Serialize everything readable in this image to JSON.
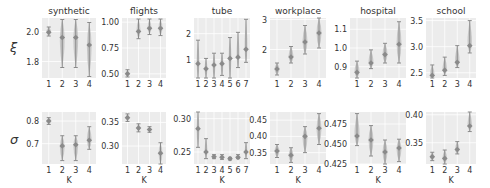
{
  "figure": {
    "row_labels": [
      "ξ",
      "σ"
    ],
    "xlabel": "K",
    "colors": {
      "panel_bg": "#ececec",
      "grid": "#ffffff",
      "marker": "#8a8a8a",
      "violin": "#b8b8b8",
      "text": "#333333"
    }
  },
  "chart_data": [
    {
      "type": "errorbar",
      "row": "xi",
      "title": "synthetic",
      "ylabel": "ξ",
      "categories": [
        "1",
        "2",
        "3",
        "4"
      ],
      "ylim": [
        1.69,
        2.09
      ],
      "yticks": [
        1.8,
        2.0
      ],
      "yticklabels": [
        "1.8",
        "2.0"
      ],
      "values": [
        1.995,
        1.96,
        1.96,
        1.91
      ],
      "lower": [
        1.97,
        1.76,
        1.76,
        1.7
      ],
      "upper": [
        2.03,
        2.08,
        2.08,
        2.06
      ]
    },
    {
      "type": "errorbar",
      "row": "xi",
      "title": "flights",
      "categories": [
        "1",
        "2",
        "3",
        "4"
      ],
      "ylim": [
        0.46,
        1.04
      ],
      "yticks": [
        0.5,
        0.75,
        1.0
      ],
      "yticklabels": [
        "0.50",
        "0.75",
        "1.00"
      ],
      "values": [
        0.5,
        0.91,
        0.94,
        0.94
      ],
      "lower": [
        0.47,
        0.84,
        0.88,
        0.87
      ],
      "upper": [
        0.54,
        1.03,
        1.03,
        1.03
      ]
    },
    {
      "type": "errorbar",
      "row": "xi",
      "title": "tube",
      "categories": [
        "1",
        "2",
        "3",
        "4",
        "5",
        "6",
        "7"
      ],
      "ylim": [
        0.3,
        2.6
      ],
      "yticks": [
        1,
        2
      ],
      "yticklabels": [
        "1",
        "2"
      ],
      "values": [
        0.85,
        0.65,
        0.8,
        0.85,
        1.05,
        1.1,
        1.4
      ],
      "lower": [
        0.3,
        0.3,
        0.3,
        0.4,
        0.3,
        0.7,
        0.9
      ],
      "upper": [
        1.75,
        1.05,
        1.25,
        1.25,
        1.85,
        2.05,
        2.55
      ]
    },
    {
      "type": "errorbar",
      "row": "xi",
      "title": "workplace",
      "categories": [
        "1",
        "2",
        "3",
        "4"
      ],
      "ylim": [
        1.05,
        3.05
      ],
      "yticks": [
        2,
        3
      ],
      "yticklabels": [
        "2",
        "3"
      ],
      "values": [
        1.35,
        1.75,
        2.25,
        2.55
      ],
      "lower": [
        1.15,
        1.55,
        1.85,
        2.05
      ],
      "upper": [
        1.55,
        2.1,
        2.8,
        3.05
      ]
    },
    {
      "type": "errorbar",
      "row": "xi",
      "title": "hospital",
      "categories": [
        "1",
        "2",
        "3",
        "4"
      ],
      "ylim": [
        0.84,
        1.16
      ],
      "yticks": [
        0.9,
        1.0,
        1.1
      ],
      "yticklabels": [
        "0.9",
        "1.0",
        "1.1"
      ],
      "values": [
        0.87,
        0.92,
        0.965,
        1.02
      ],
      "lower": [
        0.84,
        0.89,
        0.92,
        0.92
      ],
      "upper": [
        0.93,
        0.99,
        1.025,
        1.14
      ]
    },
    {
      "type": "errorbar",
      "row": "xi",
      "title": "school",
      "categories": [
        "1",
        "2",
        "3",
        "4"
      ],
      "ylim": [
        2.4,
        3.55
      ],
      "yticks": [
        2.5,
        3.0,
        3.5
      ],
      "yticklabels": [
        "2.5",
        "3.0",
        "3.5"
      ],
      "values": [
        2.45,
        2.55,
        2.7,
        3.02
      ],
      "lower": [
        2.4,
        2.45,
        2.6,
        2.88
      ],
      "upper": [
        2.65,
        2.8,
        3.02,
        3.5
      ]
    },
    {
      "type": "errorbar",
      "row": "sigma",
      "title": "",
      "ylabel": "σ",
      "xlabel": "K",
      "categories": [
        "1",
        "2",
        "3",
        "4"
      ],
      "ylim": [
        0.61,
        0.84
      ],
      "yticks": [
        0.7,
        0.8
      ],
      "yticklabels": [
        "0.7",
        "0.8"
      ],
      "values": [
        0.8,
        0.69,
        0.695,
        0.715
      ],
      "lower": [
        0.785,
        0.625,
        0.625,
        0.675
      ],
      "upper": [
        0.815,
        0.735,
        0.735,
        0.775
      ]
    },
    {
      "type": "errorbar",
      "row": "sigma",
      "title": "",
      "xlabel": "K",
      "categories": [
        "1",
        "2",
        "3",
        "4"
      ],
      "ylim": [
        0.262,
        0.372
      ],
      "yticks": [
        0.3,
        0.35
      ],
      "yticklabels": [
        "0.30",
        "0.35"
      ],
      "values": [
        0.36,
        0.338,
        0.335,
        0.285
      ],
      "lower": [
        0.352,
        0.33,
        0.329,
        0.262
      ],
      "upper": [
        0.368,
        0.347,
        0.341,
        0.307
      ]
    },
    {
      "type": "errorbar",
      "row": "sigma",
      "title": "",
      "xlabel": "K",
      "categories": [
        "1",
        "2",
        "3",
        "4",
        "5",
        "6",
        "7"
      ],
      "ylim": [
        0.232,
        0.31
      ],
      "yticks": [
        0.25,
        0.3
      ],
      "yticklabels": [
        "0.25",
        "0.30"
      ],
      "values": [
        0.285,
        0.25,
        0.243,
        0.242,
        0.24,
        0.242,
        0.25
      ],
      "lower": [
        0.257,
        0.24,
        0.24,
        0.239,
        0.238,
        0.24,
        0.24
      ],
      "upper": [
        0.31,
        0.27,
        0.246,
        0.246,
        0.242,
        0.246,
        0.264
      ]
    },
    {
      "type": "errorbar",
      "row": "sigma",
      "title": "",
      "xlabel": "K",
      "categories": [
        "1",
        "2",
        "3",
        "4"
      ],
      "ylim": [
        0.315,
        0.475
      ],
      "yticks": [
        0.35,
        0.4,
        0.45
      ],
      "yticklabels": [
        "0.35",
        "0.40",
        "0.45"
      ],
      "values": [
        0.355,
        0.342,
        0.4,
        0.425
      ],
      "lower": [
        0.335,
        0.32,
        0.35,
        0.375
      ],
      "upper": [
        0.375,
        0.365,
        0.43,
        0.47
      ]
    },
    {
      "type": "errorbar",
      "row": "sigma",
      "title": "",
      "xlabel": "K",
      "categories": [
        "1",
        "2",
        "3",
        "4"
      ],
      "ylim": [
        0.425,
        0.49
      ],
      "yticks": [
        0.425,
        0.45,
        0.475
      ],
      "yticklabels": [
        "0.425",
        "0.450",
        "0.475"
      ],
      "values": [
        0.46,
        0.455,
        0.44,
        0.445
      ],
      "lower": [
        0.448,
        0.435,
        0.425,
        0.428
      ],
      "upper": [
        0.488,
        0.473,
        0.455,
        0.456
      ]
    },
    {
      "type": "errorbar",
      "row": "sigma",
      "title": "",
      "xlabel": "K",
      "categories": [
        "1",
        "2",
        "3",
        "4"
      ],
      "ylim": [
        0.312,
        0.405
      ],
      "yticks": [
        0.35,
        0.4
      ],
      "yticklabels": [
        "0.35",
        "0.40"
      ],
      "values": [
        0.325,
        0.322,
        0.338,
        0.38
      ],
      "lower": [
        0.318,
        0.312,
        0.33,
        0.37
      ],
      "upper": [
        0.333,
        0.337,
        0.352,
        0.405
      ]
    }
  ]
}
